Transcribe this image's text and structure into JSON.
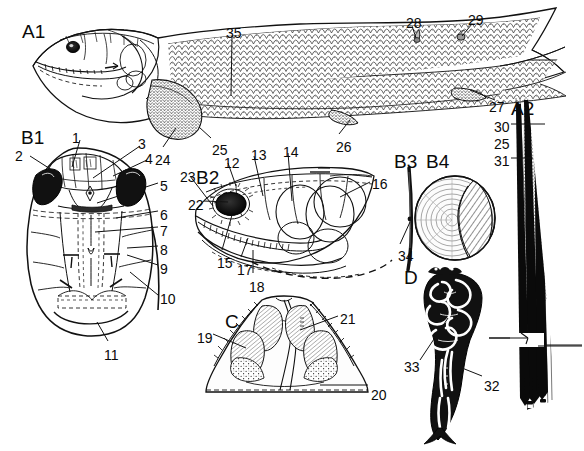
{
  "figure": {
    "type": "scientific-anatomical-plate",
    "background_color": "#ffffff",
    "ink_color": "#111111"
  },
  "panels": [
    {
      "id": "A1",
      "label": "A1",
      "x": 22,
      "y": 22,
      "caption": "whole body lateral view"
    },
    {
      "id": "A2",
      "label": "A2",
      "x": 511,
      "y": 99,
      "caption": "fin ray / lepidotrichia detail"
    },
    {
      "id": "B1",
      "label": "B1",
      "x": 21,
      "y": 128,
      "caption": "dermal skull roof, dorsal view"
    },
    {
      "id": "B2",
      "label": "B2",
      "x": 196,
      "y": 168,
      "caption": "head, lateral view"
    },
    {
      "id": "B3",
      "label": "B3",
      "x": 394,
      "y": 152,
      "caption": "scale section"
    },
    {
      "id": "B4",
      "label": "B4",
      "x": 426,
      "y": 152,
      "caption": "scale surface view"
    },
    {
      "id": "C",
      "label": "C",
      "x": 225,
      "y": 312,
      "caption": "palate, ventral view"
    },
    {
      "id": "D",
      "label": "D",
      "x": 404,
      "y": 268,
      "caption": "skeletal element, sectioned"
    }
  ],
  "numbered_labels": [
    {
      "n": "1",
      "x": 72,
      "y": 131,
      "anchor": "start"
    },
    {
      "n": "2",
      "x": 15,
      "y": 149,
      "anchor": "start"
    },
    {
      "n": "3",
      "x": 138,
      "y": 137,
      "anchor": "start"
    },
    {
      "n": "4",
      "x": 145,
      "y": 152,
      "anchor": "start"
    },
    {
      "n": "5",
      "x": 160,
      "y": 179,
      "anchor": "start"
    },
    {
      "n": "6",
      "x": 160,
      "y": 208,
      "anchor": "start"
    },
    {
      "n": "7",
      "x": 160,
      "y": 224,
      "anchor": "start"
    },
    {
      "n": "8",
      "x": 160,
      "y": 243,
      "anchor": "start"
    },
    {
      "n": "9",
      "x": 160,
      "y": 262,
      "anchor": "start"
    },
    {
      "n": "10",
      "x": 160,
      "y": 292,
      "anchor": "start"
    },
    {
      "n": "11",
      "x": 104,
      "y": 348,
      "anchor": "start"
    },
    {
      "n": "12",
      "x": 224,
      "y": 156,
      "anchor": "start"
    },
    {
      "n": "13",
      "x": 251,
      "y": 148,
      "anchor": "start"
    },
    {
      "n": "14",
      "x": 283,
      "y": 145,
      "anchor": "start"
    },
    {
      "n": "15",
      "x": 217,
      "y": 256,
      "anchor": "start"
    },
    {
      "n": "16",
      "x": 372,
      "y": 177,
      "anchor": "start"
    },
    {
      "n": "17",
      "x": 237,
      "y": 263,
      "anchor": "start"
    },
    {
      "n": "18",
      "x": 249,
      "y": 280,
      "anchor": "start"
    },
    {
      "n": "19",
      "x": 197,
      "y": 331,
      "anchor": "start"
    },
    {
      "n": "20",
      "x": 371,
      "y": 388,
      "anchor": "start"
    },
    {
      "n": "21",
      "x": 340,
      "y": 312,
      "anchor": "start"
    },
    {
      "n": "22",
      "x": 188,
      "y": 198,
      "anchor": "start"
    },
    {
      "n": "23",
      "x": 180,
      "y": 170,
      "anchor": "start"
    },
    {
      "n": "24",
      "x": 155,
      "y": 153,
      "anchor": "start"
    },
    {
      "n": "25",
      "x": 212,
      "y": 143,
      "anchor": "start"
    },
    {
      "n": "26",
      "x": 336,
      "y": 140,
      "anchor": "start"
    },
    {
      "n": "27",
      "x": 489,
      "y": 100,
      "anchor": "start"
    },
    {
      "n": "28",
      "x": 406,
      "y": 16,
      "anchor": "start"
    },
    {
      "n": "29",
      "x": 468,
      "y": 13,
      "anchor": "start"
    },
    {
      "n": "30",
      "x": 494,
      "y": 120,
      "anchor": "start"
    },
    {
      "n": "31",
      "x": 494,
      "y": 154,
      "anchor": "start"
    },
    {
      "n": "32",
      "x": 484,
      "y": 379,
      "anchor": "start"
    },
    {
      "n": "33",
      "x": 404,
      "y": 360,
      "anchor": "start"
    },
    {
      "n": "34",
      "x": 398,
      "y": 249,
      "anchor": "start"
    },
    {
      "n": "35",
      "x": 226,
      "y": 26,
      "anchor": "start"
    },
    {
      "n": "25",
      "x": 494,
      "y": 137,
      "anchor": "start"
    }
  ],
  "leader_lines": [
    {
      "from": "1",
      "x1": 80,
      "y1": 140,
      "x2": 72,
      "y2": 167
    },
    {
      "from": "2",
      "x1": 30,
      "y1": 156,
      "x2": 55,
      "y2": 172
    },
    {
      "from": "3",
      "x1": 140,
      "y1": 146,
      "x2": 93,
      "y2": 178
    },
    {
      "from": "4",
      "x1": 147,
      "y1": 160,
      "x2": 113,
      "y2": 176
    },
    {
      "from": "5",
      "x1": 158,
      "y1": 183,
      "x2": 97,
      "y2": 203
    },
    {
      "from": "6",
      "x1": 158,
      "y1": 211,
      "x2": 116,
      "y2": 218
    },
    {
      "from": "7",
      "x1": 158,
      "y1": 227,
      "x2": 95,
      "y2": 232
    },
    {
      "from": "8",
      "x1": 158,
      "y1": 246,
      "x2": 127,
      "y2": 248
    },
    {
      "from": "9",
      "x1": 158,
      "y1": 265,
      "x2": 127,
      "y2": 255
    },
    {
      "from": "10",
      "x1": 158,
      "y1": 295,
      "x2": 130,
      "y2": 272
    },
    {
      "from": "11",
      "x1": 108,
      "y1": 341,
      "x2": 97,
      "y2": 322
    },
    {
      "from": "12",
      "x1": 228,
      "y1": 163,
      "x2": 236,
      "y2": 186
    },
    {
      "from": "13",
      "x1": 254,
      "y1": 156,
      "x2": 263,
      "y2": 196
    },
    {
      "from": "14",
      "x1": 288,
      "y1": 153,
      "x2": 292,
      "y2": 201
    },
    {
      "from": "15",
      "x1": 222,
      "y1": 250,
      "x2": 232,
      "y2": 215
    },
    {
      "from": "16",
      "x1": 370,
      "y1": 182,
      "x2": 340,
      "y2": 197
    },
    {
      "from": "17",
      "x1": 241,
      "y1": 257,
      "x2": 248,
      "y2": 238
    },
    {
      "from": "18",
      "x1": 253,
      "y1": 273,
      "x2": 253,
      "y2": 250
    },
    {
      "from": "19",
      "x1": 213,
      "y1": 334,
      "x2": 246,
      "y2": 348
    },
    {
      "from": "20",
      "x1": 368,
      "y1": 385,
      "x2": 320,
      "y2": 385
    },
    {
      "from": "21",
      "x1": 338,
      "y1": 316,
      "x2": 300,
      "y2": 330
    },
    {
      "from": "22",
      "x1": 204,
      "y1": 201,
      "x2": 228,
      "y2": 202
    },
    {
      "from": "23",
      "x1": 190,
      "y1": 176,
      "x2": 213,
      "y2": 206
    },
    {
      "from": "24",
      "x1": 163,
      "y1": 147,
      "x2": 176,
      "y2": 128
    },
    {
      "from": "25",
      "x1": 211,
      "y1": 138,
      "x2": 199,
      "y2": 127
    },
    {
      "from": "26",
      "x1": 339,
      "y1": 134,
      "x2": 350,
      "y2": 120
    },
    {
      "from": "27",
      "x1": 495,
      "y1": 100,
      "x2": 470,
      "y2": 90
    },
    {
      "from": "28",
      "x1": 412,
      "y1": 26,
      "x2": 416,
      "y2": 38
    },
    {
      "from": "29",
      "x1": 472,
      "y1": 24,
      "x2": 462,
      "y2": 36
    },
    {
      "from": "30",
      "x1": 511,
      "y1": 124,
      "x2": 545,
      "y2": 124
    },
    {
      "from": "31",
      "x1": 511,
      "y1": 158,
      "x2": 533,
      "y2": 158
    },
    {
      "from": "32",
      "x1": 482,
      "y1": 376,
      "x2": 462,
      "y2": 368
    },
    {
      "from": "33",
      "x1": 420,
      "y1": 360,
      "x2": 448,
      "y2": 318
    },
    {
      "from": "34",
      "x1": 400,
      "y1": 244,
      "x2": 410,
      "y2": 222
    },
    {
      "from": "35",
      "x1": 232,
      "y1": 36,
      "x2": 231,
      "y2": 96
    }
  ],
  "style": {
    "number_font_size_px": 14,
    "panel_font_size_px": 19,
    "line_width_px": 1
  }
}
